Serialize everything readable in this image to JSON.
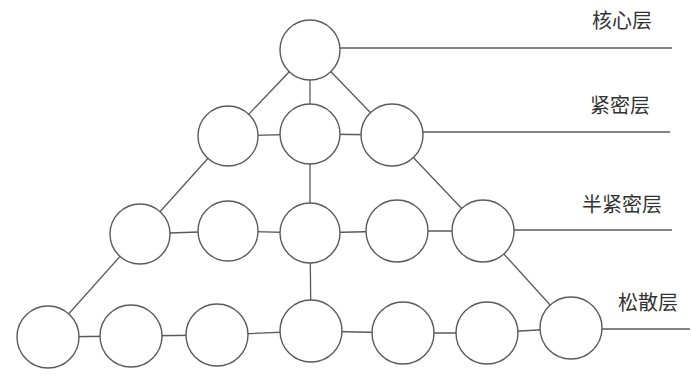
{
  "diagram": {
    "type": "pyramid-network",
    "colors": {
      "stroke": "#5a5a5a",
      "node_fill": "#ffffff",
      "label": "#333333",
      "background": "#ffffff"
    },
    "layers": [
      {
        "id": "core",
        "label": "核心层",
        "label_x": 592,
        "label_y": 28,
        "line": {
          "x1": 340,
          "y1": 48,
          "x2": 672,
          "y2": 48
        }
      },
      {
        "id": "tight",
        "label": "紧密层",
        "label_x": 590,
        "label_y": 113,
        "line": {
          "x1": 423,
          "y1": 132,
          "x2": 670,
          "y2": 132
        }
      },
      {
        "id": "semi-tight",
        "label": "半紧密层",
        "label_x": 582,
        "label_y": 212,
        "line": {
          "x1": 513,
          "y1": 230,
          "x2": 672,
          "y2": 230
        }
      },
      {
        "id": "loose",
        "label": "松散层",
        "label_x": 618,
        "label_y": 310,
        "line": {
          "x1": 602,
          "y1": 329,
          "x2": 690,
          "y2": 329
        }
      }
    ],
    "nodes": [
      {
        "id": "c1",
        "layer": "core",
        "cx": 310,
        "cy": 50,
        "r": 30
      },
      {
        "id": "t1",
        "layer": "tight",
        "cx": 228,
        "cy": 136,
        "r": 30
      },
      {
        "id": "t2",
        "layer": "tight",
        "cx": 310,
        "cy": 134,
        "r": 30
      },
      {
        "id": "t3",
        "layer": "tight",
        "cx": 392,
        "cy": 135,
        "r": 31
      },
      {
        "id": "s1",
        "layer": "semi-tight",
        "cx": 140,
        "cy": 234,
        "r": 30
      },
      {
        "id": "s2",
        "layer": "semi-tight",
        "cx": 228,
        "cy": 231,
        "r": 30
      },
      {
        "id": "s3",
        "layer": "semi-tight",
        "cx": 310,
        "cy": 233,
        "r": 30
      },
      {
        "id": "s4",
        "layer": "semi-tight",
        "cx": 397,
        "cy": 231,
        "r": 31
      },
      {
        "id": "s5",
        "layer": "semi-tight",
        "cx": 483,
        "cy": 231,
        "r": 31
      },
      {
        "id": "l1",
        "layer": "loose",
        "cx": 48,
        "cy": 337,
        "r": 31
      },
      {
        "id": "l2",
        "layer": "loose",
        "cx": 131,
        "cy": 336,
        "r": 31
      },
      {
        "id": "l3",
        "layer": "loose",
        "cx": 217,
        "cy": 335,
        "r": 31
      },
      {
        "id": "l4",
        "layer": "loose",
        "cx": 311,
        "cy": 331,
        "r": 31
      },
      {
        "id": "l5",
        "layer": "loose",
        "cx": 403,
        "cy": 333,
        "r": 31
      },
      {
        "id": "l6",
        "layer": "loose",
        "cx": 487,
        "cy": 333,
        "r": 31
      },
      {
        "id": "l7",
        "layer": "loose",
        "cx": 571,
        "cy": 328,
        "r": 31
      }
    ],
    "edges": [
      [
        "c1",
        "t1"
      ],
      [
        "c1",
        "t2"
      ],
      [
        "c1",
        "t3"
      ],
      [
        "t1",
        "t2"
      ],
      [
        "t2",
        "t3"
      ],
      [
        "t1",
        "s1"
      ],
      [
        "t2",
        "s3"
      ],
      [
        "t3",
        "s5"
      ],
      [
        "s1",
        "s2"
      ],
      [
        "s2",
        "s3"
      ],
      [
        "s3",
        "s4"
      ],
      [
        "s4",
        "s5"
      ],
      [
        "s1",
        "l1"
      ],
      [
        "s3",
        "l4"
      ],
      [
        "s5",
        "l7"
      ],
      [
        "l1",
        "l2"
      ],
      [
        "l2",
        "l3"
      ],
      [
        "l3",
        "l4"
      ],
      [
        "l4",
        "l5"
      ],
      [
        "l5",
        "l6"
      ],
      [
        "l6",
        "l7"
      ]
    ]
  }
}
